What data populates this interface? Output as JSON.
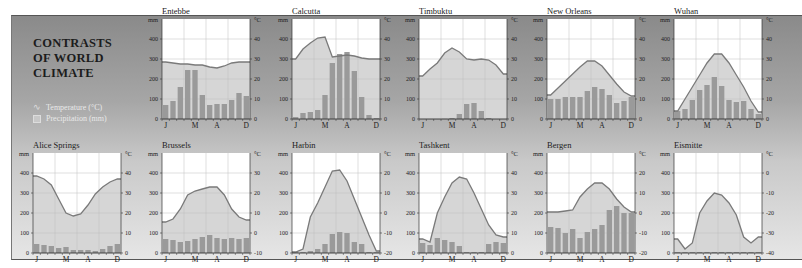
{
  "title_lines": [
    "CONTRASTS",
    "OF WORLD",
    "CLIMATE"
  ],
  "legend": {
    "temperature": "Temperature (°C)",
    "precipitation": "Precipitation (mm)"
  },
  "axis": {
    "left_unit": "mm",
    "right_unit": "°C",
    "mm_ticks": [
      0,
      100,
      200,
      300,
      400
    ],
    "month_labels": [
      {
        "label": "J",
        "index": 0
      },
      {
        "label": "M",
        "index": 4
      },
      {
        "label": "A",
        "index": 7
      },
      {
        "label": "D",
        "index": 11
      }
    ]
  },
  "colors": {
    "bar": "#9a9a9a",
    "bar_light": "#c9c9c9",
    "temp_fill": "#d6d6d6",
    "temp_line": "#7a7a7a",
    "plot_bg": "#ffffff",
    "grid": "#bdbdbd"
  },
  "chart_data": [
    {
      "type": "bar+line",
      "title": "Entebbe",
      "xlabel": "",
      "ylabel": "mm",
      "ylabel_right": "°C",
      "ylim": [
        0,
        500
      ],
      "ylim_right": [
        0,
        50
      ],
      "right_ticks": [
        0,
        10,
        20,
        30,
        40
      ],
      "categories": [
        "J",
        "F",
        "M",
        "A",
        "M",
        "J",
        "J",
        "A",
        "S",
        "O",
        "N",
        "D"
      ],
      "series": [
        {
          "name": "Precipitation (mm)",
          "values": [
            70,
            90,
            160,
            245,
            245,
            120,
            70,
            75,
            75,
            95,
            130,
            115
          ]
        },
        {
          "name": "Temperature (°C)",
          "values": [
            28.5,
            28,
            27.5,
            27.5,
            27,
            27,
            26,
            25.5,
            26.5,
            28,
            28.5,
            28.5
          ]
        }
      ]
    },
    {
      "type": "bar+line",
      "title": "Calcutta",
      "xlabel": "",
      "ylabel": "mm",
      "ylabel_right": "°C",
      "ylim": [
        0,
        500
      ],
      "ylim_right": [
        0,
        50
      ],
      "right_ticks": [
        0,
        10,
        20,
        30,
        40
      ],
      "categories": [
        "J",
        "F",
        "M",
        "A",
        "M",
        "J",
        "J",
        "A",
        "S",
        "O",
        "N",
        "D"
      ],
      "series": [
        {
          "name": "Precipitation (mm)",
          "values": [
            10,
            30,
            35,
            45,
            120,
            280,
            325,
            335,
            240,
            110,
            20,
            5
          ]
        },
        {
          "name": "Temperature (°C)",
          "values": [
            30,
            35,
            38,
            40.5,
            41,
            31,
            31.5,
            32,
            31.5,
            30.5,
            30,
            30
          ]
        }
      ]
    },
    {
      "type": "bar+line",
      "title": "Timbuktu",
      "xlabel": "",
      "ylabel": "mm",
      "ylabel_right": "°C",
      "ylim": [
        0,
        500
      ],
      "ylim_right": [
        0,
        50
      ],
      "right_ticks": [
        0,
        10,
        20,
        30,
        40
      ],
      "categories": [
        "J",
        "F",
        "M",
        "A",
        "M",
        "J",
        "J",
        "A",
        "S",
        "O",
        "N",
        "D"
      ],
      "series": [
        {
          "name": "Precipitation (mm)",
          "values": [
            0,
            0,
            0,
            1,
            5,
            25,
            75,
            80,
            40,
            5,
            0,
            0
          ]
        },
        {
          "name": "Temperature (°C)",
          "values": [
            21.5,
            25,
            28,
            33,
            35.5,
            33.5,
            30,
            29.5,
            30,
            29.5,
            27,
            22.5
          ]
        }
      ]
    },
    {
      "type": "bar+line",
      "title": "New Orleans",
      "xlabel": "",
      "ylabel": "mm",
      "ylabel_right": "°C",
      "ylim": [
        0,
        500
      ],
      "ylim_right": [
        0,
        50
      ],
      "right_ticks": [
        0,
        10,
        20,
        30,
        40
      ],
      "categories": [
        "J",
        "F",
        "M",
        "A",
        "M",
        "J",
        "J",
        "A",
        "S",
        "O",
        "N",
        "D"
      ],
      "series": [
        {
          "name": "Precipitation (mm)",
          "values": [
            100,
            100,
            110,
            110,
            110,
            140,
            160,
            150,
            120,
            80,
            90,
            110
          ]
        },
        {
          "name": "Temperature (°C)",
          "values": [
            12,
            15.5,
            19,
            22.5,
            26,
            29,
            29,
            26.5,
            22,
            17.5,
            13.5,
            11.5
          ]
        }
      ]
    },
    {
      "type": "bar+line",
      "title": "Wuhan",
      "xlabel": "",
      "ylabel": "mm",
      "ylabel_right": "°C",
      "ylim": [
        0,
        500
      ],
      "ylim_right": [
        0,
        50
      ],
      "right_ticks": [
        0,
        10,
        20,
        30,
        40
      ],
      "categories": [
        "J",
        "F",
        "M",
        "A",
        "M",
        "J",
        "J",
        "A",
        "S",
        "O",
        "N",
        "D"
      ],
      "series": [
        {
          "name": "Precipitation (mm)",
          "values": [
            40,
            50,
            95,
            145,
            170,
            210,
            165,
            95,
            85,
            90,
            50,
            25
          ]
        },
        {
          "name": "Temperature (°C)",
          "values": [
            4,
            10,
            16,
            22,
            28,
            32.5,
            32.5,
            28,
            22,
            16,
            9,
            3.5
          ]
        }
      ]
    },
    {
      "type": "bar+line",
      "title": "Alice Springs",
      "xlabel": "",
      "ylabel": "mm",
      "ylabel_right": "°C",
      "ylim": [
        0,
        500
      ],
      "ylim_right": [
        0,
        50
      ],
      "right_ticks": [
        0,
        10,
        20,
        30,
        40
      ],
      "categories": [
        "J",
        "F",
        "M",
        "A",
        "M",
        "J",
        "J",
        "A",
        "S",
        "O",
        "N",
        "D"
      ],
      "series": [
        {
          "name": "Precipitation (mm)",
          "values": [
            45,
            40,
            35,
            25,
            30,
            15,
            15,
            15,
            10,
            20,
            35,
            45
          ]
        },
        {
          "name": "Temperature (°C)",
          "values": [
            38.5,
            37,
            34,
            27,
            20,
            18.5,
            19.5,
            24,
            29.5,
            33,
            35.5,
            37
          ]
        }
      ]
    },
    {
      "type": "bar+line",
      "title": "Brussels",
      "xlabel": "",
      "ylabel": "mm",
      "ylabel_right": "°C",
      "ylim": [
        0,
        500
      ],
      "ylim_right": [
        -10,
        40
      ],
      "right_ticks": [
        -10,
        0,
        10,
        20,
        30
      ],
      "categories": [
        "J",
        "F",
        "M",
        "A",
        "M",
        "J",
        "J",
        "A",
        "S",
        "O",
        "N",
        "D"
      ],
      "series": [
        {
          "name": "Precipitation (mm)",
          "values": [
            70,
            65,
            55,
            60,
            70,
            80,
            90,
            75,
            70,
            75,
            70,
            75
          ]
        },
        {
          "name": "Temperature (°C)",
          "values": [
            5.5,
            7,
            12,
            19,
            21,
            22,
            23,
            23,
            19,
            12,
            8,
            6.5
          ]
        }
      ]
    },
    {
      "type": "bar+line",
      "title": "Harbin",
      "xlabel": "",
      "ylabel": "mm",
      "ylabel_right": "°C",
      "ylim": [
        0,
        500
      ],
      "ylim_right": [
        -20,
        30
      ],
      "right_ticks": [
        -20,
        -10,
        0,
        10,
        20
      ],
      "categories": [
        "J",
        "F",
        "M",
        "A",
        "M",
        "J",
        "J",
        "A",
        "S",
        "O",
        "N",
        "D"
      ],
      "series": [
        {
          "name": "Precipitation (mm)",
          "values": [
            5,
            5,
            10,
            20,
            45,
            95,
            105,
            100,
            55,
            45,
            5,
            5
          ]
        },
        {
          "name": "Temperature (°C)",
          "values": [
            -19.5,
            -18,
            -2,
            5,
            13,
            21,
            21.5,
            16,
            7,
            -2,
            -11,
            -19
          ]
        }
      ]
    },
    {
      "type": "bar+line",
      "title": "Tashkent",
      "xlabel": "",
      "ylabel": "mm",
      "ylabel_right": "°C",
      "ylim": [
        0,
        500
      ],
      "ylim_right": [
        0,
        50
      ],
      "right_ticks": [
        0,
        10,
        20,
        30,
        40
      ],
      "categories": [
        "J",
        "F",
        "M",
        "A",
        "M",
        "J",
        "J",
        "A",
        "S",
        "O",
        "N",
        "D"
      ],
      "series": [
        {
          "name": "Precipitation (mm)",
          "values": [
            50,
            40,
            75,
            65,
            55,
            35,
            5,
            5,
            5,
            45,
            55,
            50
          ]
        },
        {
          "name": "Temperature (°C)",
          "values": [
            7,
            5.5,
            20,
            28,
            35,
            38,
            37,
            30,
            22,
            14,
            9,
            8
          ]
        }
      ]
    },
    {
      "type": "bar+line",
      "title": "Bergen",
      "xlabel": "",
      "ylabel": "mm",
      "ylabel_right": "°C",
      "ylim": [
        0,
        500
      ],
      "ylim_right": [
        -20,
        30
      ],
      "right_ticks": [
        -20,
        -10,
        0,
        10,
        20
      ],
      "categories": [
        "J",
        "F",
        "M",
        "A",
        "M",
        "J",
        "J",
        "A",
        "S",
        "O",
        "N",
        "D"
      ],
      "series": [
        {
          "name": "Precipitation (mm)",
          "values": [
            130,
            125,
            100,
            120,
            75,
            105,
            120,
            140,
            215,
            235,
            200,
            200
          ]
        },
        {
          "name": "Temperature (°C)",
          "values": [
            0.5,
            0.5,
            1,
            1.5,
            8,
            12,
            15,
            15,
            12,
            7,
            3,
            0.5
          ]
        }
      ]
    },
    {
      "type": "bar+line",
      "title": "Eismitte",
      "xlabel": "",
      "ylabel": "mm",
      "ylabel_right": "°C",
      "ylim": [
        0,
        500
      ],
      "ylim_right": [
        -40,
        10
      ],
      "right_ticks": [
        -40,
        -30,
        -20,
        -10,
        0
      ],
      "categories": [
        "J",
        "F",
        "M",
        "A",
        "M",
        "J",
        "J",
        "A",
        "S",
        "O",
        "N",
        "D"
      ],
      "series": [
        {
          "name": "Precipitation (mm)",
          "values": [
            5,
            5,
            5,
            5,
            5,
            5,
            5,
            5,
            5,
            5,
            5,
            5
          ]
        },
        {
          "name": "Temperature (°C)",
          "values": [
            -33,
            -38,
            -35,
            -20,
            -14,
            -10,
            -11,
            -15,
            -21,
            -32,
            -35,
            -32
          ]
        }
      ]
    }
  ]
}
